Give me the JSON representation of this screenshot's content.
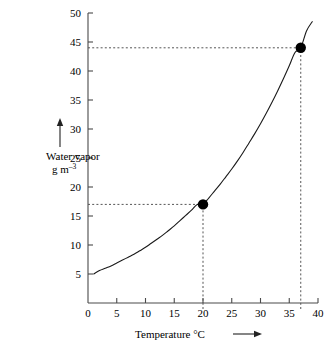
{
  "chart_data": {
    "type": "line",
    "title": "",
    "subtitle": "",
    "xlabel": "Temperature °C",
    "xlabel_arrow": "⟶",
    "ylabel_line1": "Water vapor",
    "ylabel_line2_base": "g m",
    "ylabel_line2_sup": "–3",
    "ylabel_arrow": "up-arrow",
    "xlim": [
      0,
      40
    ],
    "ylim": [
      0,
      50
    ],
    "x_ticks": [
      0,
      5,
      10,
      15,
      20,
      25,
      30,
      35,
      40
    ],
    "x_tick_labels": [
      "0",
      "5",
      "10",
      "15",
      "20",
      "25",
      "30",
      "35",
      "40"
    ],
    "y_ticks": [
      5,
      10,
      15,
      20,
      25,
      30,
      35,
      40,
      45,
      50
    ],
    "y_tick_labels": [
      "5",
      "10",
      "15",
      "20",
      "25",
      "30",
      "35",
      "40",
      "45",
      "50"
    ],
    "grid": false,
    "legend": "none",
    "curve_name": "saturation-water-vapor-curve",
    "curve": {
      "x": [
        1,
        2,
        3,
        4,
        5,
        6,
        7,
        8,
        9,
        10,
        11,
        12,
        13,
        14,
        15,
        16,
        17,
        18,
        19,
        20,
        21,
        22,
        23,
        24,
        25,
        26,
        27,
        28,
        29,
        30,
        31,
        32,
        33,
        34,
        35,
        36,
        37,
        38,
        39
      ],
      "y": [
        5.0,
        5.6,
        6.0,
        6.4,
        6.9,
        7.4,
        7.9,
        8.4,
        9.0,
        9.6,
        10.3,
        11.0,
        11.7,
        12.5,
        13.3,
        14.2,
        15.1,
        16.0,
        17.0,
        17.0,
        18.1,
        19.3,
        20.5,
        21.8,
        23.1,
        24.5,
        26.0,
        27.6,
        29.2,
        30.9,
        32.7,
        34.6,
        36.6,
        38.7,
        40.9,
        43.2,
        44.0,
        46.9,
        48.5
      ]
    },
    "points": [
      {
        "name": "point-20c",
        "x": 20,
        "y": 17,
        "label": ""
      },
      {
        "name": "point-37c",
        "x": 37,
        "y": 44,
        "label": ""
      }
    ],
    "guide_lines": [
      {
        "name": "guide-h-17",
        "orientation": "horizontal",
        "value": 17,
        "from": 0,
        "to": 20,
        "style": "dashed"
      },
      {
        "name": "guide-v-20",
        "orientation": "vertical",
        "value": 20,
        "from": 0,
        "to": 17,
        "style": "dashed"
      },
      {
        "name": "guide-h-44",
        "orientation": "horizontal",
        "value": 44,
        "from": 0,
        "to": 37,
        "style": "dashed"
      },
      {
        "name": "guide-v-37",
        "orientation": "vertical",
        "value": 37,
        "from": 0,
        "to": 44,
        "style": "dashed"
      }
    ],
    "colors": {
      "curve": "#1a1a1a",
      "axis": "#4a4a4a",
      "point": "#000000",
      "guide": "#555555",
      "text": "#000000",
      "background": "#ffffff"
    }
  }
}
